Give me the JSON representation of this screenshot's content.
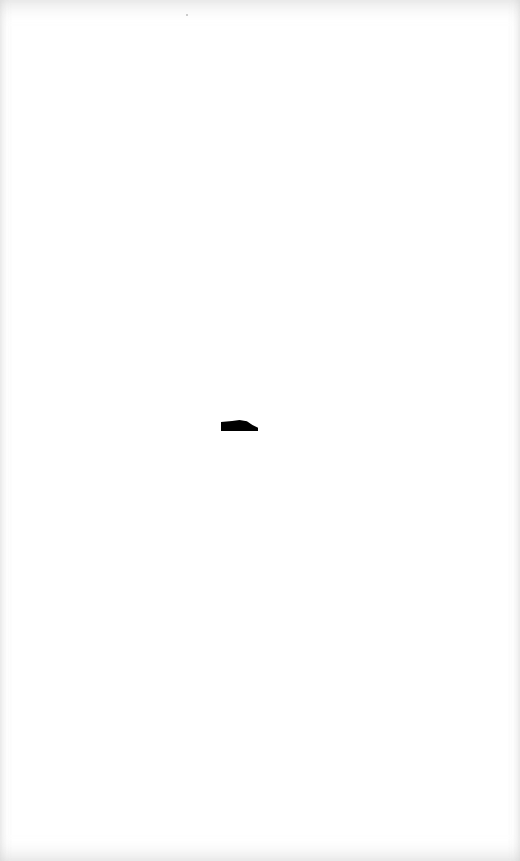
{
  "page": {
    "background_color": "#ffffff",
    "edge_shade_color": "#c8c8c8",
    "marks": [
      {
        "type": "ink-blob",
        "color": "#000000",
        "x": 221,
        "y": 420,
        "width": 37,
        "height": 11
      }
    ],
    "text": ""
  }
}
